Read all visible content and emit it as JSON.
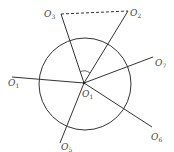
{
  "diagram": {
    "type": "geometry",
    "circle": {
      "cx": 85,
      "cy": 84,
      "r": 46
    },
    "center": {
      "x": 84,
      "y": 83,
      "label": "O",
      "sub": "1"
    },
    "labels": [
      {
        "id": "top-left",
        "text": "O",
        "sub": "3",
        "x": 44,
        "y": 17
      },
      {
        "id": "top-right",
        "text": "O",
        "sub": "2",
        "x": 130,
        "y": 16
      },
      {
        "id": "right",
        "text": "O",
        "sub": "7",
        "x": 155,
        "y": 66
      },
      {
        "id": "left",
        "text": "O",
        "sub": "1",
        "x": 8,
        "y": 86
      },
      {
        "id": "bottom-right",
        "text": "O",
        "sub": "6",
        "x": 151,
        "y": 140
      },
      {
        "id": "bottom",
        "text": "O",
        "sub": "5",
        "x": 61,
        "y": 150
      }
    ],
    "center_label": {
      "text": "O",
      "sub": "1",
      "x": 82,
      "y": 97
    },
    "lines": [
      {
        "id": "to-top-left",
        "x1": 84,
        "y1": 83,
        "x2": 61,
        "y2": 14
      },
      {
        "id": "to-top-right",
        "x1": 84,
        "y1": 83,
        "x2": 128,
        "y2": 11
      },
      {
        "id": "to-right",
        "x1": 84,
        "y1": 83,
        "x2": 153,
        "y2": 57
      },
      {
        "id": "to-left",
        "x1": 84,
        "y1": 83,
        "x2": 12,
        "y2": 77
      },
      {
        "id": "to-bottom-right",
        "x1": 84,
        "y1": 83,
        "x2": 152,
        "y2": 127
      },
      {
        "id": "to-bottom",
        "x1": 84,
        "y1": 83,
        "x2": 60,
        "y2": 143
      }
    ],
    "dashed_segment": {
      "x1": 61,
      "y1": 14,
      "x2": 128,
      "y2": 11
    }
  }
}
